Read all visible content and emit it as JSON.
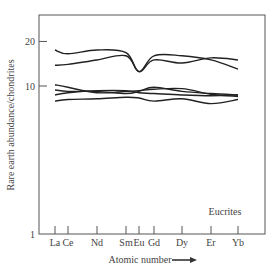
{
  "chart_data": {
    "type": "line",
    "title": "",
    "xlabel": "Atomic number",
    "ylabel": "Rare earth abundance/chondrites",
    "yscale": "log",
    "ylim": [
      1,
      25
    ],
    "yticks": [
      1,
      10,
      20
    ],
    "ytick_labels": [
      "1",
      "10",
      "20"
    ],
    "categories": [
      "La",
      "Ce",
      "Nd",
      "Sm",
      "Eu",
      "Gd",
      "Dy",
      "Er",
      "Yb"
    ],
    "grid": false,
    "legend": null,
    "annotations": [
      "Eucrites"
    ],
    "series": [
      {
        "name": "Eucrite 1",
        "values": [
          17.5,
          16.5,
          17.5,
          16.8,
          12.5,
          16.0,
          16.0,
          15.0,
          13.0
        ]
      },
      {
        "name": "Eucrite 2",
        "values": [
          13.8,
          14.0,
          15.0,
          16.0,
          12.5,
          15.0,
          14.3,
          15.5,
          15.0
        ]
      },
      {
        "name": "Eucrite 3",
        "values": [
          10.2,
          9.8,
          9.0,
          9.2,
          9.3,
          9.5,
          9.6,
          8.8,
          8.5
        ]
      },
      {
        "name": "Eucrite 4",
        "values": [
          9.4,
          9.2,
          9.2,
          8.9,
          9.2,
          9.8,
          9.2,
          8.9,
          8.7
        ]
      },
      {
        "name": "Eucrite 5",
        "values": [
          8.7,
          9.0,
          9.3,
          9.3,
          9.0,
          8.9,
          8.7,
          8.6,
          8.7
        ]
      },
      {
        "name": "Eucrite 6",
        "values": [
          7.9,
          8.1,
          8.2,
          8.4,
          8.3,
          7.9,
          8.2,
          7.6,
          8.1
        ]
      }
    ]
  },
  "plot": {
    "x_positions": [
      55,
      68,
      97,
      126,
      139,
      154,
      182,
      211,
      238
    ],
    "frame": {
      "left": 39,
      "top": 15,
      "right": 265,
      "bottom": 234
    },
    "y_px_per_decade": 148,
    "line_color": "#222222",
    "axis_color": "#555555",
    "annotation_x": 225,
    "annotation_y": 215,
    "arrow_label": "→"
  }
}
